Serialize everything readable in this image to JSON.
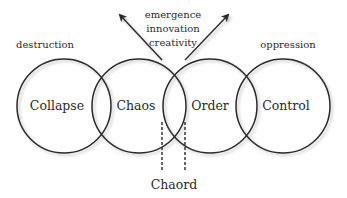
{
  "diagram": {
    "circles": [
      {
        "id": "collapse",
        "label": "Collapse",
        "cx": 64,
        "cy": 106,
        "r": 47,
        "above_label": "destruction"
      },
      {
        "id": "chaos",
        "label": "Chaos",
        "cx": 139,
        "cy": 106,
        "r": 47,
        "above_label": ""
      },
      {
        "id": "order",
        "label": "Order",
        "cx": 210,
        "cy": 106,
        "r": 47,
        "above_label": ""
      },
      {
        "id": "control",
        "label": "Control",
        "cx": 283,
        "cy": 106,
        "r": 47,
        "above_label": "oppression"
      }
    ],
    "top_labels": {
      "destruction": "destruction",
      "oppression": "oppression",
      "emergence": "emergence",
      "innovation": "innovation",
      "creativity": "creativity"
    },
    "chaord_label": "Chaord",
    "stroke_color": "#2a2a2a",
    "background_color": "#ffffff"
  }
}
